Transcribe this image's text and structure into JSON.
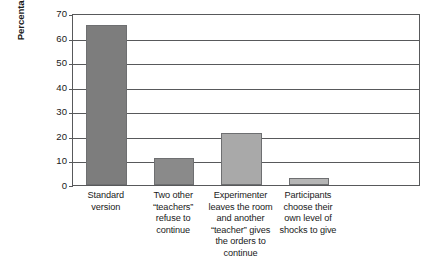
{
  "chart_data": {
    "type": "bar",
    "title": "",
    "subtitle": "",
    "xlabel": "",
    "ylabel": "Percentage giving the highest level of shock",
    "ylim": [
      0,
      70
    ],
    "ytick_values": [
      0,
      10,
      20,
      30,
      40,
      50,
      60,
      70
    ],
    "ytick_labels": [
      "0",
      "10",
      "20",
      "30",
      "40",
      "50",
      "60",
      "70"
    ],
    "grid": true,
    "legend": false,
    "legend_position": "none",
    "categories": [
      "Standard version",
      "Two other “teachers” refuse to continue",
      "Experimenter leaves the room and another “teacher” gives the orders to continue",
      "Participants choose their own level of shocks to give"
    ],
    "category_lines": [
      [
        "Standard",
        "version"
      ],
      [
        "Two other",
        "“teachers”",
        "refuse to",
        "continue"
      ],
      [
        "Experimenter",
        "leaves the room",
        "and another",
        "“teacher” gives",
        "the orders to",
        "continue"
      ],
      [
        "Participants",
        "choose their",
        "own level of",
        "shocks to give"
      ]
    ],
    "values": [
      65,
      11,
      21,
      3
    ],
    "bar_colors": [
      "#7d7d7d",
      "#8a8a8a",
      "#a9a9a9",
      "#b5b5b5"
    ],
    "bar_border_color": "#6e6f71",
    "axis_color": "#58595b",
    "text_color": "#1a1a1a",
    "background": "#ffffff"
  }
}
